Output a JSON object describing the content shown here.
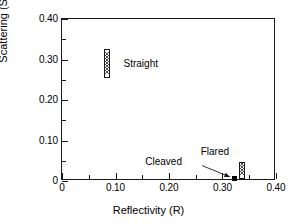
{
  "chart_data": {
    "type": "scatter",
    "title": "",
    "xlabel": "Reflectivity  (R)",
    "ylabel": "Scattering (S)",
    "xlim": [
      0,
      0.4
    ],
    "ylim": [
      0,
      0.4
    ],
    "grid": false,
    "legend": "none",
    "xticks": [
      {
        "value": 0.0,
        "label": "0"
      },
      {
        "value": 0.1,
        "label": "0.10"
      },
      {
        "value": 0.2,
        "label": "0.20"
      },
      {
        "value": 0.3,
        "label": "0.30"
      },
      {
        "value": 0.4,
        "label": "0.40"
      }
    ],
    "xminor": [
      0.05,
      0.15,
      0.25,
      0.35
    ],
    "yticks": [
      {
        "value": 0.0,
        "label": "0"
      },
      {
        "value": 0.1,
        "label": "0.10"
      },
      {
        "value": 0.2,
        "label": "0.20"
      },
      {
        "value": 0.3,
        "label": "0.30"
      },
      {
        "value": 0.4,
        "label": "0.40"
      }
    ],
    "yminor": [
      0.05,
      0.15,
      0.25,
      0.35
    ],
    "points": [
      {
        "name": "Straight",
        "label": "Straight",
        "marker": "hatched-bar",
        "x": 0.085,
        "y": 0.29,
        "y_low": 0.255,
        "y_high": 0.325,
        "label_x": 0.115,
        "label_y": 0.29
      },
      {
        "name": "Cleaved",
        "label": "Cleaved",
        "marker": "filled-square",
        "x": 0.322,
        "y": 0.005,
        "label_x": 0.228,
        "label_y": 0.048
      },
      {
        "name": "Flared",
        "label": "Flared",
        "marker": "hatched-bar",
        "x": 0.336,
        "y": 0.025,
        "y_low": 0.004,
        "y_high": 0.047,
        "label_x": 0.316,
        "label_y": 0.072
      }
    ],
    "annotations": [
      {
        "name": "cleaved-arrow",
        "from_x": 0.262,
        "from_y": 0.038,
        "to_x": 0.314,
        "to_y": 0.01
      }
    ],
    "colors": {
      "axis": "#1a1a1a",
      "marker_fill": "#000000",
      "hatch": "#4d4d4d",
      "background": "#ffffff"
    }
  }
}
